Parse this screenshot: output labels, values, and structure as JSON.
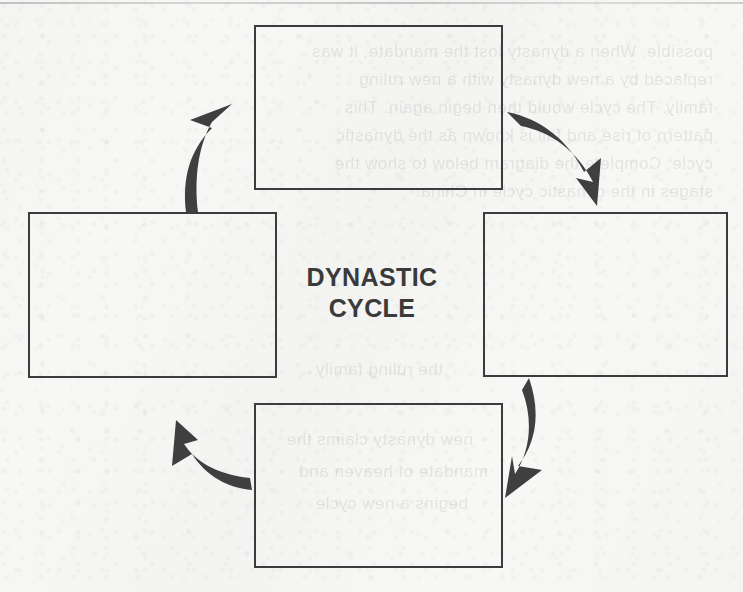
{
  "page": {
    "kind": "scanned-worksheet-diagram",
    "width": 743,
    "height": 592,
    "paper_color": "#f7f7f6",
    "ink_color": "#3c3c3c"
  },
  "diagram": {
    "name": "dynastic-cycle-diagram",
    "center_label": {
      "line1": "DYNASTIC",
      "line2": "CYCLE"
    },
    "boxes": [
      {
        "id": "top",
        "label": "",
        "x": 254,
        "y": 25,
        "width": 249,
        "height": 165
      },
      {
        "id": "right",
        "label": "",
        "x": 483,
        "y": 212,
        "width": 245,
        "height": 165
      },
      {
        "id": "bottom",
        "label": "",
        "x": 254,
        "y": 403,
        "width": 249,
        "height": 165
      },
      {
        "id": "left",
        "label": "",
        "x": 28,
        "y": 212,
        "width": 249,
        "height": 166
      }
    ],
    "arrows": [
      {
        "id": "top-to-right",
        "from": "top",
        "to": "right",
        "direction": "clockwise"
      },
      {
        "id": "right-to-bottom",
        "from": "right",
        "to": "bottom",
        "direction": "clockwise"
      },
      {
        "id": "bottom-to-left",
        "from": "bottom",
        "to": "left",
        "direction": "clockwise"
      },
      {
        "id": "left-to-top",
        "from": "left",
        "to": "top",
        "direction": "clockwise"
      }
    ]
  },
  "bleed_through": {
    "note": "illegible mirrored ghost text from reverse side of the scanned page",
    "lines": [
      {
        "x": 30,
        "y": 42,
        "size": 17,
        "text": "possible. When a dynasty lost the mandate, it was"
      },
      {
        "x": 30,
        "y": 70,
        "size": 17,
        "text": "replaced by a new dynasty with a new ruling"
      },
      {
        "x": 30,
        "y": 98,
        "size": 17,
        "text": "family. The cycle would then begin again. This"
      },
      {
        "x": 30,
        "y": 126,
        "size": 17,
        "text": "pattern of rise and fall is known as the dynastic"
      },
      {
        "x": 30,
        "y": 154,
        "size": 17,
        "text": "cycle. Complete the diagram below to show the"
      },
      {
        "x": 30,
        "y": 182,
        "size": 17,
        "text": "stages in the dynastic cycle in China."
      },
      {
        "x": 300,
        "y": 360,
        "size": 17,
        "text": "the ruling family"
      },
      {
        "x": 270,
        "y": 430,
        "size": 17,
        "text": "new dynasty claims the"
      },
      {
        "x": 255,
        "y": 462,
        "size": 17,
        "text": "mandate of heaven and"
      },
      {
        "x": 275,
        "y": 494,
        "size": 17,
        "text": "begins a new cycle"
      }
    ]
  }
}
